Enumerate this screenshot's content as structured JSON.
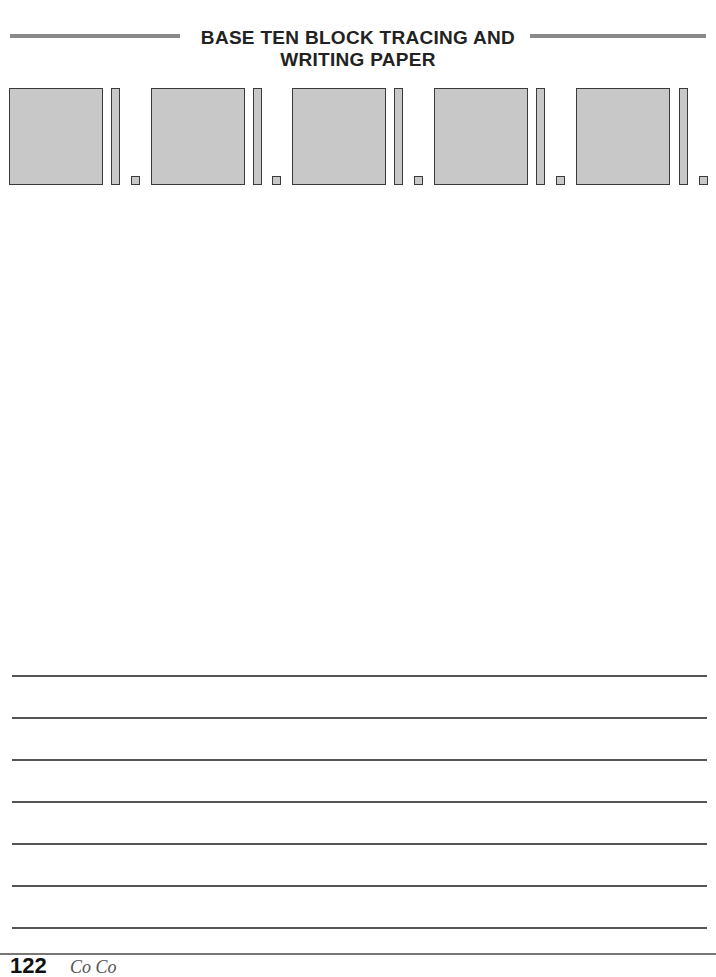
{
  "header": {
    "title_line1": "BASE TEN BLOCK TRACING AND",
    "title_line2": "WRITING PAPER",
    "rule_color": "#8a8a8a"
  },
  "blocks": {
    "groups": 5,
    "fill_color": "#c8c8c8",
    "border_color": "#3a3a3a",
    "items": [
      {
        "hundred": "flat",
        "ten": "rod",
        "one": "unit"
      },
      {
        "hundred": "flat",
        "ten": "rod",
        "one": "unit"
      },
      {
        "hundred": "flat",
        "ten": "rod",
        "one": "unit"
      },
      {
        "hundred": "flat",
        "ten": "rod",
        "one": "unit"
      },
      {
        "hundred": "flat",
        "ten": "rod",
        "one": "unit"
      }
    ]
  },
  "writing_lines": {
    "count": 7,
    "line_color": "#555555"
  },
  "footer": {
    "page_number": "122",
    "text": "Co  Co"
  }
}
